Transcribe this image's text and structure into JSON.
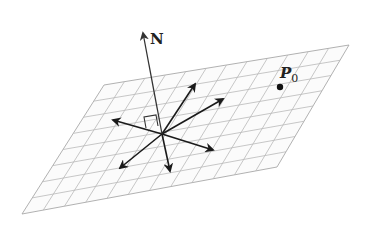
{
  "diagram": {
    "plane": {
      "corners": [
        [
          104,
          85
        ],
        [
          349,
          45
        ],
        [
          277,
          167
        ],
        [
          22,
          214
        ]
      ],
      "grid_divisions_u": 12,
      "grid_divisions_v": 8,
      "fill_color": "#fbfbfb",
      "grid_color": "#b9b9b9"
    },
    "origin": [
      162,
      134
    ],
    "normal_vector": {
      "label": "N",
      "tip": [
        143,
        33
      ],
      "label_pos": [
        150,
        44
      ]
    },
    "plane_vectors": [
      {
        "name": "up-right",
        "tip": [
          195,
          84
        ]
      },
      {
        "name": "right",
        "tip": [
          223,
          99
        ]
      },
      {
        "name": "left",
        "tip": [
          113,
          120
        ]
      },
      {
        "name": "lower-right",
        "tip": [
          213,
          150
        ]
      },
      {
        "name": "lower-left",
        "tip": [
          120,
          168
        ]
      },
      {
        "name": "down",
        "tip": [
          170,
          171
        ]
      }
    ],
    "right_angle_marker": true,
    "point": {
      "label": "P",
      "subscript": "0",
      "pos": [
        280,
        87
      ],
      "label_pos": [
        280,
        78
      ]
    },
    "colors": {
      "vector": "#1a1a1a",
      "normal": "#333333",
      "text": "#222222"
    }
  }
}
